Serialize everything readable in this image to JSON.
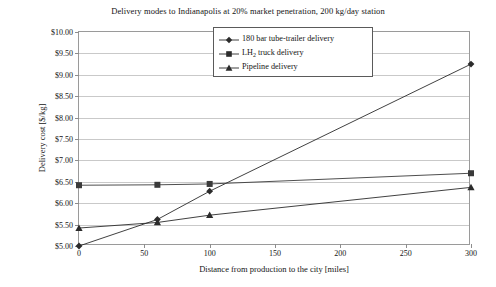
{
  "chart_data": {
    "type": "line",
    "title": "Delivery modes to Indianapolis at 20% market penetration, 200 kg/day station",
    "xlabel": "Distance from production to the city [miles]",
    "ylabel": "Delivery cost [$/kg]",
    "xlim": [
      0,
      300
    ],
    "ylim": [
      5.0,
      10.0
    ],
    "xticks": [
      0,
      50,
      100,
      150,
      200,
      250,
      300
    ],
    "xtick_labels": [
      "0",
      "50",
      "100",
      "150",
      "200",
      "250",
      "300"
    ],
    "yticks": [
      5.0,
      5.5,
      6.0,
      6.5,
      7.0,
      7.5,
      8.0,
      8.5,
      9.0,
      9.5,
      10.0
    ],
    "ytick_labels": [
      "$5.00",
      "$5.50",
      "$6.00",
      "$6.50",
      "$7.00",
      "$7.50",
      "$8.00",
      "$8.50",
      "$9.00",
      "$9.50",
      "$10.00"
    ],
    "grid": true,
    "legend_position": "top-center",
    "series": [
      {
        "name": "180 bar tube-trailer delivery",
        "marker": "diamond",
        "color": "#2b2b2b",
        "x": [
          0,
          60,
          100,
          300
        ],
        "values": [
          5.0,
          5.62,
          6.28,
          9.25
        ]
      },
      {
        "name": "LH2 truck delivery",
        "marker": "square",
        "color": "#3a3a3a",
        "x": [
          0,
          60,
          100,
          300
        ],
        "values": [
          6.42,
          6.43,
          6.45,
          6.7
        ]
      },
      {
        "name": "Pipeline delivery",
        "marker": "triangle",
        "color": "#2b2b2b",
        "x": [
          0,
          60,
          100,
          300
        ],
        "values": [
          5.42,
          5.55,
          5.72,
          6.37
        ]
      }
    ],
    "legend_entries": [
      {
        "label_plain": "180 bar tube-trailer delivery",
        "label_pre": "180 bar tube-trailer delivery",
        "label_sub": "",
        "label_post": "",
        "marker": "diamond"
      },
      {
        "label_plain": "LH2 truck delivery",
        "label_pre": "LH",
        "label_sub": "2",
        "label_post": " truck delivery",
        "marker": "square"
      },
      {
        "label_plain": "Pipeline delivery",
        "label_pre": "Pipeline delivery",
        "label_sub": "",
        "label_post": "",
        "marker": "triangle"
      }
    ],
    "colors": {
      "axis": "#9a9a9a",
      "grid": "#c9c9c9",
      "line": "#2b2b2b",
      "background": "#ffffff"
    }
  }
}
